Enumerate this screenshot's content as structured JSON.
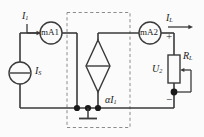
{
  "figure": {
    "kind": "electrical-circuit-schematic",
    "background_color": "#fbfbfb",
    "line_color": "#3a3a3a",
    "dashed_box_color": "#8c8c8c"
  },
  "labels": {
    "input_current": "I",
    "input_current_sub": "1",
    "source_current": "I",
    "source_current_sub": "S",
    "load_current": "I",
    "load_current_sub": "L",
    "output_voltage": "U",
    "output_voltage_sub": "2",
    "load_resistor": "R",
    "load_resistor_sub": "L",
    "dependent_source": "αI",
    "dependent_source_sub": "1",
    "plus_sign": "+",
    "minus_sign": "−"
  },
  "meters": {
    "left": {
      "name": "mA1",
      "prefix": "mA",
      "index": "1"
    },
    "right": {
      "name": "mA2",
      "prefix": "mA",
      "index": "2"
    }
  },
  "components": [
    {
      "id": "current-source-is",
      "type": "independent-current-source",
      "label": "IS"
    },
    {
      "id": "ammeter-ma1",
      "type": "ammeter",
      "label": "mA1"
    },
    {
      "id": "dependent-current-source",
      "type": "current-controlled-current-source",
      "label": "alpha I1"
    },
    {
      "id": "ammeter-ma2",
      "type": "ammeter",
      "label": "mA2"
    },
    {
      "id": "load-potentiometer",
      "type": "potentiometer",
      "label": "RL"
    },
    {
      "id": "ground",
      "type": "earth-ground",
      "label": ""
    }
  ],
  "nodes": {
    "junction_dots": 4,
    "ground_present": true
  }
}
